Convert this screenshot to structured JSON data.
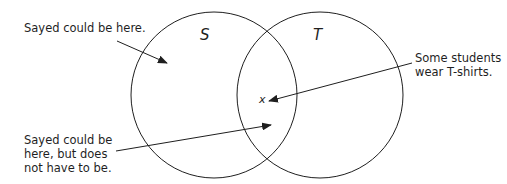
{
  "diagram": {
    "sets": [
      {
        "name": "S",
        "cx": 214,
        "cy": 95,
        "r": 83
      },
      {
        "name": "T",
        "cx": 320,
        "cy": 95,
        "r": 83
      }
    ],
    "marker": {
      "symbol": "x"
    },
    "annotations": [
      {
        "id": "top-left",
        "lines": [
          "Sayed could be here."
        ]
      },
      {
        "id": "right",
        "lines": [
          "Some students",
          "wear T-shirts."
        ]
      },
      {
        "id": "bottom-left",
        "lines": [
          "Sayed could be",
          "here, but does",
          "not have to be."
        ]
      }
    ],
    "colors": {
      "stroke": "#1f1f1f",
      "background": "#ffffff"
    }
  }
}
